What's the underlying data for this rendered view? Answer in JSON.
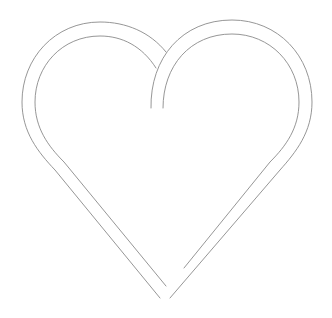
{
  "image": {
    "subject": "heart-outline-icon",
    "style": "double-line outline, interlaced at top center",
    "colors": {
      "background": "#ffffff",
      "line": "#8a8a8a"
    }
  }
}
